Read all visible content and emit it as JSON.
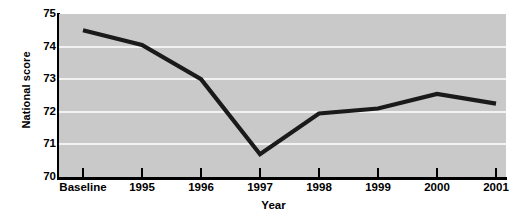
{
  "chart_data": {
    "type": "line",
    "title": "",
    "xlabel": "Year",
    "ylabel": "National score",
    "categories": [
      "Baseline",
      "1995",
      "1996",
      "1997",
      "1998",
      "1999",
      "2000",
      "2001"
    ],
    "values": [
      74.5,
      74.05,
      73.0,
      70.7,
      71.95,
      72.1,
      72.55,
      72.25
    ],
    "series": [
      {
        "name": "National score",
        "values": [
          74.5,
          74.05,
          73.0,
          70.7,
          71.95,
          72.1,
          72.55,
          72.25
        ]
      }
    ],
    "ylim": [
      70,
      75
    ],
    "y_ticks": [
      70,
      71,
      72,
      73,
      74,
      75
    ],
    "y_tick_labels": [
      "70",
      "71",
      "72",
      "73",
      "74",
      "75"
    ],
    "grid": true,
    "grid_axis": "y",
    "legend": "none",
    "colors": {
      "line": "#1a1a1a",
      "plot_background": "#c9c9c9",
      "gridline": "#f2f2f2",
      "axis": "#000000",
      "figure_background": "#ffffff",
      "text": "#000000"
    }
  },
  "axes": {
    "x_title": "Year",
    "y_title": "National score"
  }
}
